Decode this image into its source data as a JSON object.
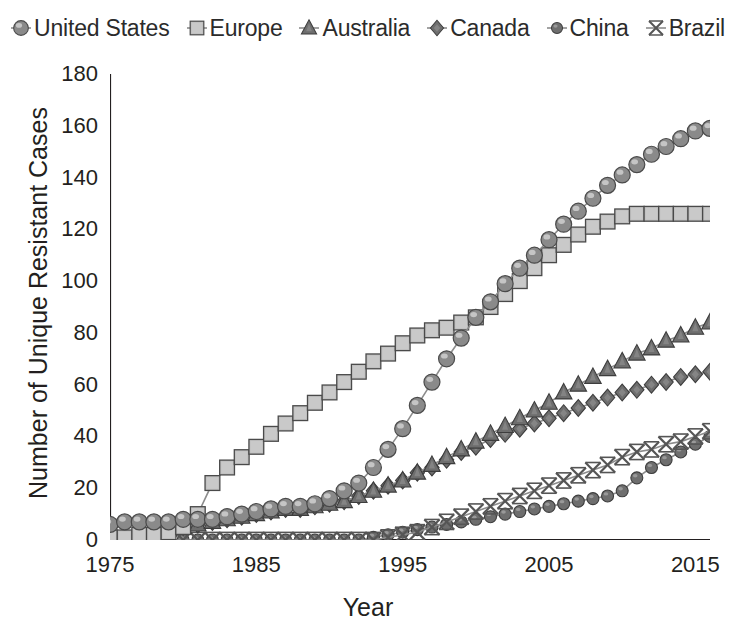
{
  "chart_data": {
    "type": "line",
    "title": "",
    "xlabel": "Year",
    "ylabel": "Number of Unique Resistant Cases",
    "xlim": [
      1975,
      2016
    ],
    "ylim": [
      0,
      180
    ],
    "xticks": [
      1975,
      1985,
      1995,
      2005,
      2015
    ],
    "yticks": [
      0,
      20,
      40,
      60,
      80,
      100,
      120,
      140,
      160,
      180
    ],
    "grid": false,
    "legend_position": "top",
    "x": [
      1975,
      1976,
      1977,
      1978,
      1979,
      1980,
      1981,
      1982,
      1983,
      1984,
      1985,
      1986,
      1987,
      1988,
      1989,
      1990,
      1991,
      1992,
      1993,
      1994,
      1995,
      1996,
      1997,
      1998,
      1999,
      2000,
      2001,
      2002,
      2003,
      2004,
      2005,
      2006,
      2007,
      2008,
      2009,
      2010,
      2011,
      2012,
      2013,
      2014,
      2015,
      2016
    ],
    "series": [
      {
        "name": "United States",
        "marker": "circle",
        "color": "#8a8a8a",
        "values": [
          6,
          7,
          7,
          7,
          7,
          8,
          8,
          8,
          9,
          10,
          11,
          12,
          13,
          13,
          14,
          16,
          19,
          22,
          28,
          35,
          43,
          52,
          61,
          70,
          78,
          86,
          92,
          99,
          105,
          110,
          116,
          122,
          127,
          132,
          137,
          141,
          145,
          149,
          152,
          155,
          158,
          159
        ]
      },
      {
        "name": "Europe",
        "marker": "square",
        "color": "#bfbfbf",
        "values": [
          1,
          1,
          2,
          2,
          3,
          5,
          10,
          22,
          28,
          32,
          36,
          41,
          45,
          49,
          53,
          57,
          61,
          65,
          69,
          72,
          76,
          79,
          81,
          82,
          84,
          86,
          90,
          95,
          100,
          105,
          110,
          114,
          118,
          121,
          123,
          125,
          126,
          126,
          126,
          126,
          126,
          126
        ]
      },
      {
        "name": "Australia",
        "marker": "triangle",
        "color": "#6e6e6e",
        "values": [
          1,
          1,
          2,
          3,
          4,
          5,
          6,
          7,
          8,
          9,
          10,
          11,
          12,
          12,
          13,
          14,
          15,
          17,
          19,
          21,
          23,
          26,
          29,
          32,
          35,
          38,
          41,
          44,
          47,
          50,
          53,
          57,
          60,
          63,
          66,
          69,
          72,
          74,
          77,
          79,
          82,
          84
        ]
      },
      {
        "name": "Canada",
        "marker": "diamond",
        "color": "#6e6e6e",
        "values": [
          1,
          1,
          2,
          3,
          4,
          5,
          6,
          7,
          8,
          9,
          10,
          11,
          12,
          12,
          13,
          14,
          15,
          17,
          19,
          21,
          23,
          26,
          28,
          31,
          34,
          36,
          39,
          41,
          43,
          45,
          47,
          49,
          51,
          53,
          55,
          57,
          58,
          60,
          61,
          63,
          64,
          65
        ]
      },
      {
        "name": "China",
        "marker": "circle-small",
        "color": "#6e6e6e",
        "values": [
          0,
          0,
          0,
          0,
          0,
          0,
          0,
          0,
          0,
          0,
          0,
          0,
          0,
          0,
          0,
          0,
          0,
          0,
          1,
          2,
          3,
          4,
          5,
          6,
          7,
          8,
          9,
          10,
          11,
          12,
          13,
          14,
          15,
          16,
          17,
          19,
          24,
          28,
          31,
          34,
          37,
          40
        ]
      },
      {
        "name": "Brazil",
        "marker": "x",
        "color": "#6e6e6e",
        "values": [
          0,
          0,
          0,
          0,
          0,
          0,
          0,
          0,
          0,
          0,
          0,
          0,
          0,
          0,
          0,
          0,
          0,
          0,
          0,
          1,
          2,
          3,
          5,
          7,
          9,
          11,
          13,
          15,
          17,
          19,
          21,
          23,
          25,
          27,
          29,
          32,
          34,
          35,
          37,
          38,
          40,
          42
        ]
      }
    ]
  },
  "legend": {
    "items": [
      {
        "label": "United States"
      },
      {
        "label": "Europe"
      },
      {
        "label": "Australia"
      },
      {
        "label": "Canada"
      },
      {
        "label": "China"
      },
      {
        "label": "Brazil"
      }
    ]
  },
  "axes": {
    "x_title": "Year",
    "y_title": "Number of Unique Resistant Cases"
  }
}
